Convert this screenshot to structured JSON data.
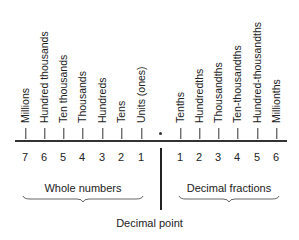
{
  "places": {
    "whole": [
      {
        "label": "Millions",
        "digit": "7"
      },
      {
        "label": "Hundred thousands",
        "digit": "6"
      },
      {
        "label": "Ten thousands",
        "digit": "5"
      },
      {
        "label": "Thousands",
        "digit": "4"
      },
      {
        "label": "Hundreds",
        "digit": "3"
      },
      {
        "label": "Tens",
        "digit": "2"
      },
      {
        "label": "Units (ones)",
        "digit": "1"
      }
    ],
    "decimal": [
      {
        "label": "Tenths",
        "digit": "1"
      },
      {
        "label": "Hundredths",
        "digit": "2"
      },
      {
        "label": "Thousandths",
        "digit": "3"
      },
      {
        "label": "Ten-thousandths",
        "digit": "4"
      },
      {
        "label": "Hundred-thousandths",
        "digit": "5"
      },
      {
        "label": "Millionths",
        "digit": "6"
      }
    ]
  },
  "groups": {
    "whole_label": "Whole numbers",
    "decimal_label": "Decimal fractions"
  },
  "decimal_point_label": "Decimal point"
}
